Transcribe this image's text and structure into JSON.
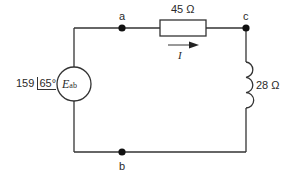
{
  "circuit": {
    "source": {
      "magnitude": "159",
      "angle": "65°",
      "symbol": "E",
      "subscript": "ab"
    },
    "resistor": {
      "label": "45 Ω"
    },
    "inductor": {
      "label": "28 Ω"
    },
    "current": {
      "label": "I"
    },
    "nodes": {
      "a": "a",
      "b": "b",
      "c": "c"
    },
    "colors": {
      "wire": "#333333",
      "background": "#ffffff"
    }
  }
}
